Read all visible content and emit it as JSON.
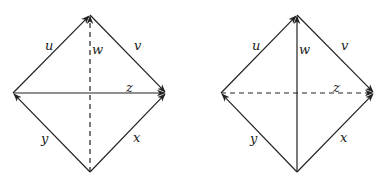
{
  "diagrams": [
    {
      "id": "left",
      "vertices": {
        "top": [
          90,
          15
        ],
        "left": [
          13,
          93
        ],
        "right": [
          166,
          93
        ],
        "bottom": [
          90,
          172
        ]
      },
      "edges": [
        {
          "label": "u",
          "from": "left",
          "to": "top",
          "style": "solid",
          "label_pos": [
            45,
            50
          ]
        },
        {
          "label": "v",
          "from": "top",
          "to": "right",
          "style": "solid",
          "label_pos": [
            134,
            50
          ]
        },
        {
          "label": "z",
          "from": "left",
          "to": "right",
          "style": "solid",
          "label_pos": [
            126,
            92
          ]
        },
        {
          "label": "y",
          "from": "bottom",
          "to": "left",
          "style": "solid",
          "label_pos": [
            41,
            143
          ]
        },
        {
          "label": "x",
          "from": "bottom",
          "to": "right",
          "style": "solid",
          "label_pos": [
            133,
            142
          ]
        },
        {
          "label": "w",
          "from": "bottom",
          "to": "top",
          "style": "dashed",
          "label_pos": [
            92,
            54
          ]
        }
      ]
    },
    {
      "id": "right",
      "vertices": {
        "top": [
          297,
          15
        ],
        "left": [
          221,
          93
        ],
        "right": [
          374,
          93
        ],
        "bottom": [
          297,
          172
        ]
      },
      "edges": [
        {
          "label": "u",
          "from": "left",
          "to": "top",
          "style": "solid",
          "label_pos": [
            252,
            50
          ]
        },
        {
          "label": "v",
          "from": "top",
          "to": "right",
          "style": "solid",
          "label_pos": [
            341,
            50
          ]
        },
        {
          "label": "z",
          "from": "left",
          "to": "right",
          "style": "dashed",
          "label_pos": [
            333,
            92
          ]
        },
        {
          "label": "y",
          "from": "bottom",
          "to": "left",
          "style": "solid",
          "label_pos": [
            250,
            143
          ]
        },
        {
          "label": "x",
          "from": "bottom",
          "to": "right",
          "style": "solid",
          "label_pos": [
            340,
            142
          ]
        },
        {
          "label": "w",
          "from": "bottom",
          "to": "top",
          "style": "solid",
          "label_pos": [
            299,
            54
          ]
        }
      ]
    }
  ]
}
